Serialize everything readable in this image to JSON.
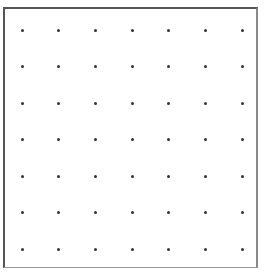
{
  "diagram": {
    "type": "dot-grid",
    "rows": 7,
    "columns": 7,
    "dot_color": "#333333",
    "border_color": "#555555",
    "background_color": "#ffffff",
    "dot_x_positions": [
      22,
      58,
      95,
      132,
      168,
      205,
      242
    ],
    "dot_y_positions": [
      30,
      66,
      103,
      139,
      176,
      212,
      249
    ]
  }
}
